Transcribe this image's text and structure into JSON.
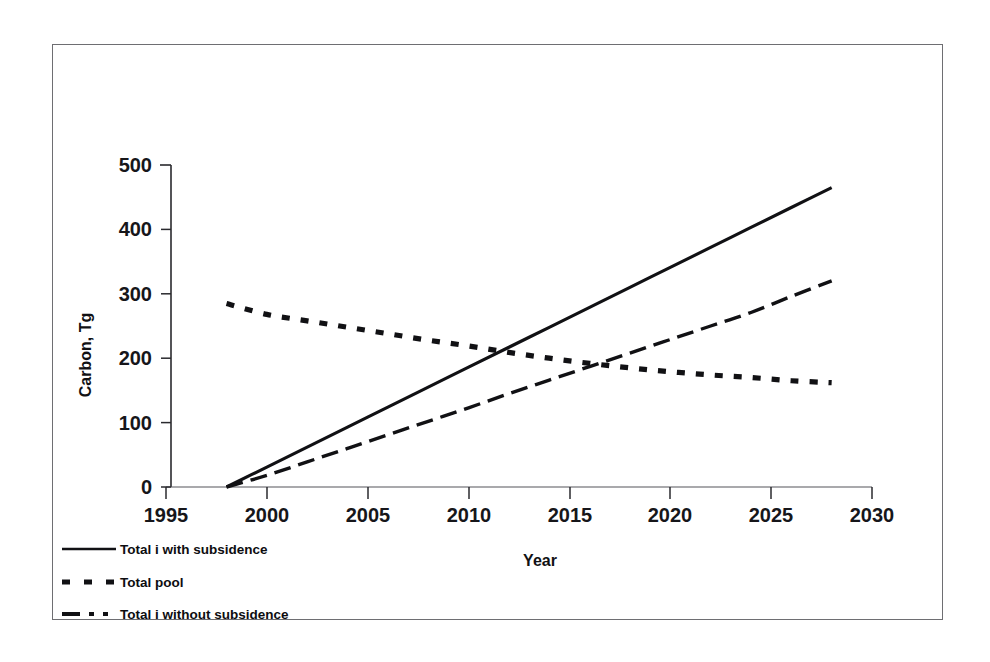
{
  "chart_data": {
    "type": "line",
    "title": "",
    "xlabel": "Year",
    "ylabel": "Carbon, Tg",
    "xlim": [
      1995,
      2030
    ],
    "ylim": [
      0,
      500
    ],
    "xticks": [
      1995,
      2000,
      2005,
      2010,
      2015,
      2020,
      2025,
      2030
    ],
    "yticks": [
      0,
      100,
      200,
      300,
      400,
      500
    ],
    "grid": false,
    "legend_position": "below-axis-left",
    "x": [
      1998,
      2000,
      2002,
      2004,
      2006,
      2008,
      2010,
      2012,
      2014,
      2016,
      2018,
      2020,
      2022,
      2024,
      2026,
      2028
    ],
    "series": [
      {
        "name": "Total i with subsidence",
        "style": "solid",
        "values": [
          0,
          31,
          62,
          93,
          124,
          155,
          186,
          217,
          248,
          279,
          310,
          341,
          372,
          403,
          434,
          465
        ]
      },
      {
        "name": "Total pool",
        "style": "dotted",
        "values": [
          285,
          268,
          258,
          248,
          238,
          228,
          219,
          209,
          200,
          192,
          185,
          179,
          174,
          170,
          165,
          162
        ]
      },
      {
        "name": "Total i without subsidence",
        "style": "dash-dot",
        "values": [
          0,
          18,
          39,
          60,
          81,
          102,
          123,
          145,
          166,
          187,
          208,
          229,
          250,
          271,
          296,
          320
        ]
      }
    ]
  },
  "legend": {
    "items": [
      {
        "label": "Total i with subsidence",
        "style": "solid"
      },
      {
        "label": "Total pool",
        "style": "dotted"
      },
      {
        "label": "Total i without subsidence",
        "style": "dash-dot"
      }
    ]
  },
  "axes": {
    "y_tick_labels": [
      "500",
      "400",
      "300",
      "200",
      "100",
      "0"
    ],
    "x_tick_labels": [
      "1995",
      "2000",
      "2005",
      "2010",
      "2015",
      "2020",
      "2025",
      "2030"
    ],
    "y_axis_title": "Carbon, Tg",
    "x_axis_title": "Year"
  },
  "colors": {
    "ink": "#111114",
    "frame": "#6e6e72",
    "axis": "#2a2a2e",
    "background": "#ffffff"
  }
}
